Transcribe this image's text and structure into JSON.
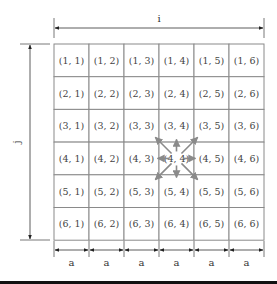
{
  "diagram": {
    "type": "grid-neighborhood",
    "rows": 6,
    "cols": 6,
    "cells": [
      [
        "(1, 1)",
        "(1, 2)",
        "(1, 3)",
        "(1, 4)",
        "(1, 5)",
        "(1, 6)"
      ],
      [
        "(2, 1)",
        "(2, 2)",
        "(2, 3)",
        "(2, 4)",
        "(2, 5)",
        "(2, 6)"
      ],
      [
        "(3, 1)",
        "(3, 2)",
        "(3, 3)",
        "(3, 4)",
        "(3, 5)",
        "(3, 6)"
      ],
      [
        "(4, 1)",
        "(4, 2)",
        "(4, 3)",
        "(4, 4)",
        "(4, 5)",
        "(4, 6)"
      ],
      [
        "(5, 1)",
        "(5, 2)",
        "(5, 3)",
        "(5, 4)",
        "(5, 5)",
        "(5, 6)"
      ],
      [
        "(6, 1)",
        "(6, 2)",
        "(6, 3)",
        "(6, 4)",
        "(6, 5)",
        "(6, 6)"
      ]
    ],
    "center_cell": "(4, 4)",
    "neighbor_arrows": 8,
    "horizontal_dimension_label": "i",
    "vertical_dimension_label": "j",
    "cell_width_labels": [
      "a",
      "a",
      "a",
      "a",
      "a",
      "a"
    ],
    "colors": {
      "grid_line": "#8a8a8a",
      "arrow": "#8a8a8a",
      "dimension_line": "#333333",
      "text": "#444444"
    }
  }
}
